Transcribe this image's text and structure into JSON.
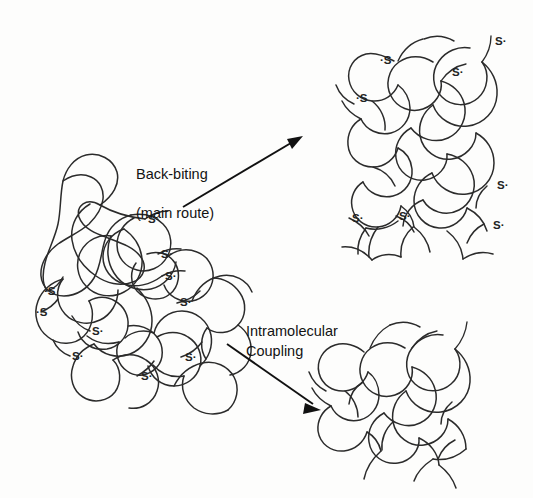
{
  "figure": {
    "type": "reaction-scheme",
    "background_color": "#fdfdfc",
    "line_color": "#2b2b2b",
    "text_color": "#131313"
  },
  "labels": {
    "route_top_line1": "Back-biting",
    "route_top_line2": "(main route)",
    "route_bottom_line1": "Intramolecular",
    "route_bottom_line2": "Coupling"
  },
  "structures": {
    "reactant": {
      "name": "expanded-polymer-coil",
      "radical_count": 10,
      "radicals": [
        {
          "text": "S·",
          "x": 148,
          "y": 220,
          "align": "left"
        },
        {
          "text": "S·",
          "x": 161,
          "y": 255,
          "align": "left"
        },
        {
          "text": "S·",
          "x": 165,
          "y": 277,
          "align": "left"
        },
        {
          "text": "·S",
          "x": 44,
          "y": 292,
          "align": "left"
        },
        {
          "text": "·S",
          "x": 36,
          "y": 313,
          "align": "left"
        },
        {
          "text": "S·",
          "x": 180,
          "y": 303,
          "align": "left"
        },
        {
          "text": "S·",
          "x": 92,
          "y": 332,
          "align": "left"
        },
        {
          "text": "S·",
          "x": 72,
          "y": 357,
          "align": "left"
        },
        {
          "text": "S·",
          "x": 185,
          "y": 358,
          "align": "left"
        },
        {
          "text": "S·",
          "x": 141,
          "y": 377,
          "align": "left"
        }
      ]
    },
    "product_top": {
      "name": "back-biting-collapsed-coil",
      "radical_count": 8,
      "radicals": [
        {
          "text": "·S",
          "x": 380,
          "y": 61,
          "align": "left"
        },
        {
          "text": "S·",
          "x": 495,
          "y": 42,
          "align": "left"
        },
        {
          "text": "S·",
          "x": 452,
          "y": 73,
          "align": "left"
        },
        {
          "text": "·S",
          "x": 356,
          "y": 99,
          "align": "left"
        },
        {
          "text": "S·",
          "x": 497,
          "y": 186,
          "align": "left"
        },
        {
          "text": "S·",
          "x": 493,
          "y": 226,
          "align": "left"
        },
        {
          "text": "S·",
          "x": 352,
          "y": 219,
          "align": "left"
        },
        {
          "text": "S·",
          "x": 399,
          "y": 217,
          "align": "left"
        }
      ]
    },
    "product_bottom": {
      "name": "intramolecularly-coupled-globule",
      "radical_count": 0,
      "radicals": []
    }
  },
  "arrows": [
    {
      "name": "back-biting-arrow",
      "x1": 183,
      "y1": 207,
      "x2": 302,
      "y2": 136
    },
    {
      "name": "intramolecular-coupling-arrow",
      "x1": 227,
      "y1": 344,
      "x2": 320,
      "y2": 409
    }
  ]
}
